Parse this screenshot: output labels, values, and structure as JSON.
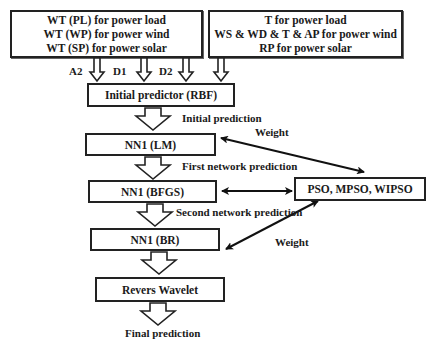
{
  "inputs": {
    "left_box": {
      "lines": [
        "WT (PL) for power load",
        "WT (WP) for power wind",
        "WT (SP) for power solar"
      ]
    },
    "right_box": {
      "lines": [
        "T for power load",
        "WS & WD & T & AP for power wind",
        "RP for power solar"
      ]
    },
    "arrow_labels": [
      "A2",
      "D1",
      "D2"
    ]
  },
  "pipeline": {
    "initial_predictor": "Initial predictor (RBF)",
    "nn1_lm": "NN1 (LM)",
    "nn1_bfgs": "NN1 (BFGS)",
    "nn1_br": "NN1 (BR)",
    "revers_wavelet": "Revers Wavelet"
  },
  "optimizer": {
    "label": "PSO, MPSO, WIPSO"
  },
  "edge_labels": {
    "initial_prediction": "Initial prediction",
    "first_network_prediction": "First network prediction",
    "second_network_prediction": "Second network prediction",
    "weight_top": "Weight",
    "weight_bottom": "Weight",
    "final_prediction": "Final prediction"
  }
}
